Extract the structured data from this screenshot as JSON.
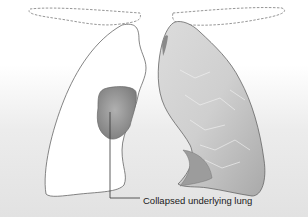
{
  "figure": {
    "type": "medical illustration",
    "colors": {
      "background_top": "#ffffff",
      "background_bottom": "#e6e6e6",
      "outline": "#555555",
      "lung_fill_light": "#d9d9d9",
      "lung_fill_dark": "#a8a8a8",
      "collapsed_lung": "#9a9a9a",
      "dashed_outline": "#8a8a8a"
    },
    "annotations": [
      {
        "label": "Collapsed underlying lung",
        "points_to": "collapsed-lung-left"
      }
    ]
  }
}
